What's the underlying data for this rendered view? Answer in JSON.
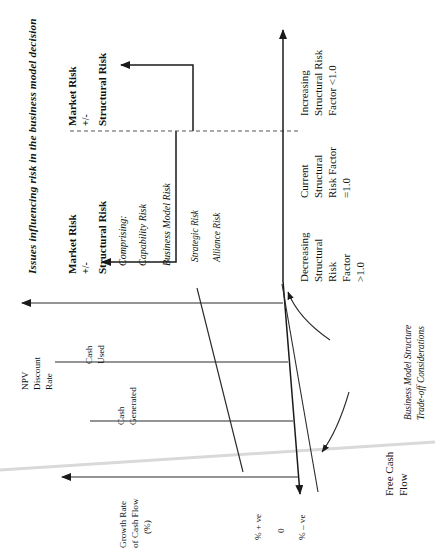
{
  "figure": {
    "title": "Issues influencing risk in the business model decision",
    "orientation": "rotated-90"
  },
  "risk_panel": {
    "left_group": {
      "line1": "Market Risk",
      "line2": "+/-",
      "line3": "Structural Risk"
    },
    "right_group": {
      "line1": "Market Risk",
      "line2": "+/-",
      "line3": "Structural Risk"
    },
    "comprising_label": "Comprising:",
    "components": [
      "Capability Risk",
      "Business Model Risk",
      "Strategic Risk",
      "Alliance Risk"
    ]
  },
  "vertical_axis": {
    "below_origin": {
      "line1": "Decreasing",
      "line2": "Structural",
      "line3": "Risk",
      "line4": "Factor",
      "line5": ">1.0"
    },
    "at_origin": {
      "line1": "Current",
      "line2": "Structural",
      "line3": "Risk Factor",
      "line4": "=1.0"
    },
    "above_origin": {
      "line1": "Increasing",
      "line2": "Structural Risk",
      "line3": "Factor <1.0"
    }
  },
  "horizontal_axis": {
    "label_line1": "Free Cash",
    "label_line2": "Flow",
    "annotation_line1": "Business Model Structure",
    "annotation_line2": "Trade-off Considerations"
  },
  "chart_rows": {
    "npv": {
      "line1": "NPV",
      "line2": "Discount",
      "line3": "Rate"
    },
    "cash_used": {
      "line1": "Cash",
      "line2": "Used"
    },
    "cash_generated": {
      "line1": "Cash",
      "line2": "Generated"
    },
    "growth": {
      "line1": "Growth Rate",
      "line2": "of Cash Flow",
      "line3": "(%)"
    }
  },
  "scale_ticks": {
    "positive": "% + ve",
    "zero": "0",
    "negative": "% – ve"
  },
  "colors": {
    "ink": "#1a1a1a",
    "dashed": "#555555",
    "scanline": "#d9d9d9",
    "paper": "#ffffff"
  }
}
